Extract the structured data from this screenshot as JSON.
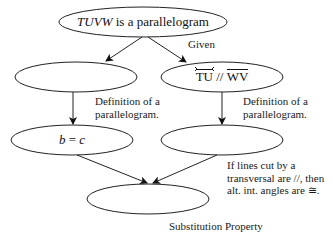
{
  "nodes": {
    "top": {
      "italic": "TUVW",
      "rest": " is a parallelogram"
    },
    "left1": {
      "text": ""
    },
    "right1": {
      "line": "TU",
      "sep": " // ",
      "segment": "WV"
    },
    "left2": {
      "text": "b = c",
      "parts": [
        "b",
        " = ",
        "c"
      ]
    },
    "right2": {
      "text": ""
    },
    "bottom": {
      "text": ""
    }
  },
  "reasons": {
    "given": "Given",
    "def_left": [
      "Definition of a",
      "parallelogram."
    ],
    "def_right": [
      "Definition of a",
      "parallelogram."
    ],
    "alt_int": [
      "If lines cut by a",
      "transversal are //, then",
      "alt. int. angles are ≅."
    ],
    "substitution": "Substitution Property"
  }
}
